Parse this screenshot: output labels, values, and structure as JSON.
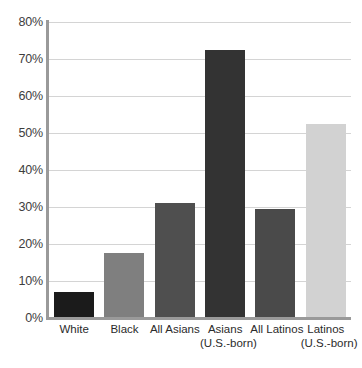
{
  "chart_data": {
    "type": "bar",
    "title": "",
    "subtitle": "",
    "xlabel": "",
    "ylabel": "",
    "ylim": [
      0,
      80
    ],
    "grid": true,
    "legend": "none",
    "categories": [
      "White",
      "Black",
      "All Asians",
      "Asians (U.S.-born)",
      "All Latinos",
      "Latinos (U.S.-born)"
    ],
    "values": [
      7,
      17.5,
      31,
      72.5,
      29.5,
      52.5
    ],
    "value_labels": [
      "7%",
      "17.5%",
      "31%",
      "72.5%",
      "29.5%",
      "52.5%"
    ],
    "bar_colors": [
      "#1b1b1b",
      "#7f7f7f",
      "#4f4f4f",
      "#333333",
      "#4a4a4a",
      "#d2d2d2"
    ],
    "ytick_labels": [
      "0%",
      "10%",
      "20%",
      "30%",
      "40%",
      "50%",
      "60%",
      "70%",
      "80%"
    ],
    "ytick_values": [
      0,
      10,
      20,
      30,
      40,
      50,
      60,
      70,
      80
    ],
    "xtick_lines": [
      {
        "line1": "White",
        "line2": ""
      },
      {
        "line1": "Black",
        "line2": ""
      },
      {
        "line1": "All Asians",
        "line2": ""
      },
      {
        "line1": "Asians",
        "line2": "(U.S.-born)"
      },
      {
        "line1": "All Latinos",
        "line2": ""
      },
      {
        "line1": "Latinos",
        "line2": "(U.S.-born)"
      }
    ]
  },
  "colors": {
    "background": "#ffffff",
    "axis": "#9a9a9a",
    "gridline": "#d4d4d4",
    "tick_text": "#3d3d3d",
    "category_text": "#2b2b2b"
  }
}
